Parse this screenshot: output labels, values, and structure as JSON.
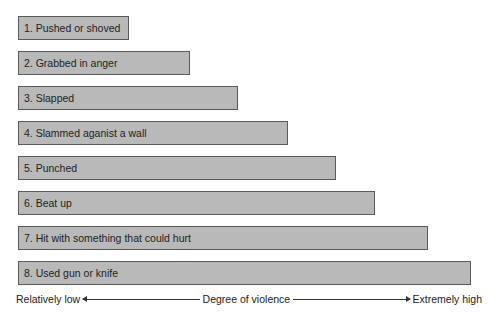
{
  "diagram": {
    "type": "ranked-horizontal-bars",
    "bars": [
      {
        "rank": 1,
        "label": "1. Pushed or shoved",
        "width": 111
      },
      {
        "rank": 2,
        "label": "2. Grabbed in anger",
        "width": 172
      },
      {
        "rank": 3,
        "label": "3. Slapped",
        "width": 220
      },
      {
        "rank": 4,
        "label": "4. Slammed aganist a wall",
        "width": 270
      },
      {
        "rank": 5,
        "label": "5. Punched",
        "width": 318
      },
      {
        "rank": 6,
        "label": "6. Beat up",
        "width": 357
      },
      {
        "rank": 7,
        "label": "7. Hit with something that could hurt",
        "width": 410
      },
      {
        "rank": 8,
        "label": "8. Used gun or knife",
        "width": 453
      }
    ],
    "axis": {
      "low_label": "Relatively low",
      "title": "Degree of violence",
      "high_label": "Extremely high"
    },
    "colors": {
      "bar_fill": "#b9b9b9",
      "bar_border": "#5a5a5a",
      "text": "#222222"
    }
  }
}
